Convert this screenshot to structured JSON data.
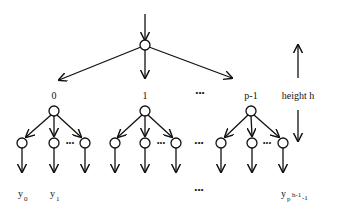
{
  "diagram": {
    "type": "tree",
    "root": {
      "label": ""
    },
    "branch_labels": [
      "0",
      "1",
      "...",
      "p-1"
    ],
    "group_ellipsis": "•••",
    "height_label": "height h",
    "leaf_labels": {
      "first": {
        "base": "y",
        "sub": "0"
      },
      "second": {
        "base": "y",
        "sub": "1"
      },
      "ellipsis": "•••",
      "last": {
        "base": "y",
        "sub_base": "p",
        "sup": "h-1",
        "sub_tail": "-1"
      }
    },
    "colors": {
      "stroke": "#111111",
      "node_fill": "#ffffff",
      "background": "#ffffff"
    }
  }
}
